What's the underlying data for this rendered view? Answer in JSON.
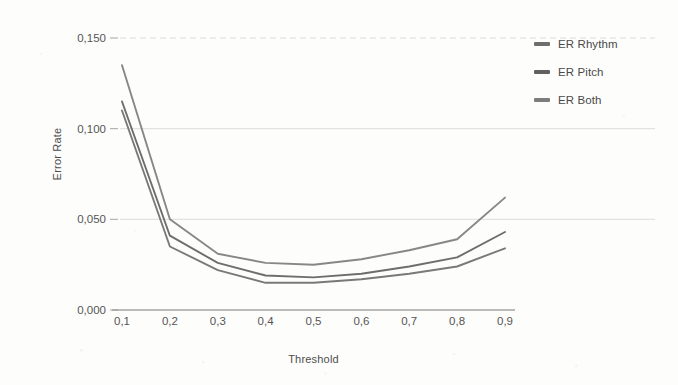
{
  "chart_data": {
    "type": "line",
    "title": "",
    "xlabel": "Threshold",
    "ylabel": "Error Rate",
    "x": [
      0.1,
      0.2,
      0.3,
      0.4,
      0.5,
      0.6,
      0.7,
      0.8,
      0.9
    ],
    "xtick_labels": [
      "0,1",
      "0,2",
      "0,3",
      "0,4",
      "0,5",
      "0,6",
      "0,7",
      "0,8",
      "0,9"
    ],
    "ytick_labels": [
      "0,000",
      "0,050",
      "0,100",
      "0,150"
    ],
    "ytick_values": [
      0.0,
      0.05,
      0.1,
      0.15
    ],
    "xlim": [
      0.1,
      0.9
    ],
    "ylim": [
      0.0,
      0.15
    ],
    "grid": "horizontal",
    "legend_position": "right",
    "series": [
      {
        "name": "ER Rhythm",
        "color": "#6e6e6e",
        "values": [
          0.11,
          0.035,
          0.022,
          0.015,
          0.015,
          0.017,
          0.02,
          0.024,
          0.034
        ]
      },
      {
        "name": "ER Pitch",
        "color": "#616161",
        "values": [
          0.115,
          0.041,
          0.026,
          0.019,
          0.018,
          0.02,
          0.024,
          0.029,
          0.043
        ]
      },
      {
        "name": "ER Both",
        "color": "#7d7d7d",
        "values": [
          0.135,
          0.05,
          0.031,
          0.026,
          0.025,
          0.028,
          0.033,
          0.039,
          0.062
        ]
      }
    ]
  },
  "legend": {
    "items": [
      {
        "label": "ER Rhythm"
      },
      {
        "label": "ER Pitch"
      },
      {
        "label": "ER Both"
      }
    ]
  },
  "axes": {
    "y_title": "Error Rate",
    "x_title": "Threshold"
  }
}
